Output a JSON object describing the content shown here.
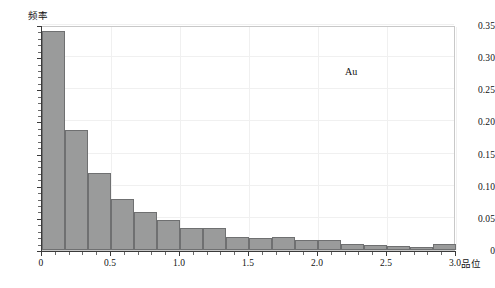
{
  "chart_data": {
    "type": "bar",
    "title": "",
    "subtitle": "",
    "xlabel": "品位",
    "ylabel": "频率",
    "xlim": [
      0,
      3.0
    ],
    "ylim": [
      0,
      0.35
    ],
    "grid": true,
    "legend_position": "inside-top-right",
    "annotations": [
      {
        "text": "Au",
        "x": 2.2,
        "y": 0.29
      }
    ],
    "bin_width": 0.1667,
    "x_tick_labels": [
      "0",
      "0.5",
      "1.0",
      "1.5",
      "2.0",
      "2.5",
      "3.0"
    ],
    "x_tick_values": [
      0,
      0.5,
      1.0,
      1.5,
      2.0,
      2.5,
      3.0
    ],
    "y_tick_labels": [
      "0",
      "0.05",
      "0.10",
      "0.15",
      "0.20",
      "0.25",
      "0.30",
      "0.35"
    ],
    "y_tick_values": [
      0,
      0.05,
      0.1,
      0.15,
      0.2,
      0.25,
      0.3,
      0.35
    ],
    "series": [
      {
        "name": "Au",
        "color": "#9a9b9b",
        "edge_color": "#6f7071",
        "bins": [
          {
            "x0": 0.0,
            "x1": 0.1667,
            "value": 0.34
          },
          {
            "x0": 0.1667,
            "x1": 0.3333,
            "value": 0.187
          },
          {
            "x0": 0.3333,
            "x1": 0.5,
            "value": 0.12
          },
          {
            "x0": 0.5,
            "x1": 0.6667,
            "value": 0.079
          },
          {
            "x0": 0.6667,
            "x1": 0.8333,
            "value": 0.059
          },
          {
            "x0": 0.8333,
            "x1": 1.0,
            "value": 0.046
          },
          {
            "x0": 1.0,
            "x1": 1.1667,
            "value": 0.034
          },
          {
            "x0": 1.1667,
            "x1": 1.3333,
            "value": 0.034
          },
          {
            "x0": 1.3333,
            "x1": 1.5,
            "value": 0.021
          },
          {
            "x0": 1.5,
            "x1": 1.6667,
            "value": 0.018
          },
          {
            "x0": 1.6667,
            "x1": 1.8333,
            "value": 0.021
          },
          {
            "x0": 1.8333,
            "x1": 2.0,
            "value": 0.016
          },
          {
            "x0": 2.0,
            "x1": 2.1667,
            "value": 0.016
          },
          {
            "x0": 2.1667,
            "x1": 2.3333,
            "value": 0.01
          },
          {
            "x0": 2.3333,
            "x1": 2.5,
            "value": 0.008
          },
          {
            "x0": 2.5,
            "x1": 2.6667,
            "value": 0.006
          },
          {
            "x0": 2.6667,
            "x1": 2.8333,
            "value": 0.005
          },
          {
            "x0": 2.8333,
            "x1": 3.0,
            "value": 0.01
          }
        ]
      }
    ]
  },
  "caption": {
    "text": ""
  }
}
